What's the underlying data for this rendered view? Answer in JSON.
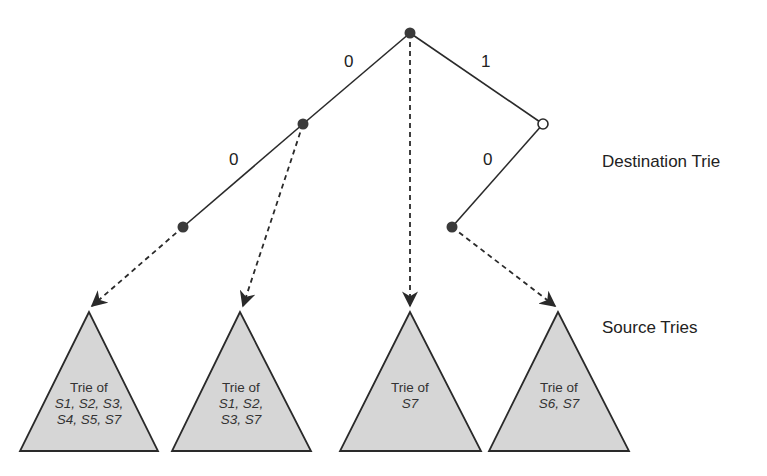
{
  "labels": {
    "destination": "Destination Trie",
    "source": "Source Tries"
  },
  "edges": [
    {
      "label": "0",
      "from": "root",
      "to": "n0"
    },
    {
      "label": "1",
      "from": "root",
      "to": "n1"
    },
    {
      "label": "0",
      "from": "n0",
      "to": "n00"
    },
    {
      "label": "0",
      "from": "n1",
      "to": "n10"
    }
  ],
  "source_tries": [
    {
      "title": "Trie of",
      "line1": "S1, S2, S3,",
      "line2": "S4, S5, S7"
    },
    {
      "title": "Trie of",
      "line1": "S1, S2,",
      "line2": "S3, S7"
    },
    {
      "title": "Trie of",
      "line1": "S7",
      "line2": ""
    },
    {
      "title": "Trie of",
      "line1": "S6, S7",
      "line2": ""
    }
  ],
  "colors": {
    "line": "#2a2a2a",
    "node": "#3a3a3a",
    "triangle_fill": "#d6d6d6"
  }
}
